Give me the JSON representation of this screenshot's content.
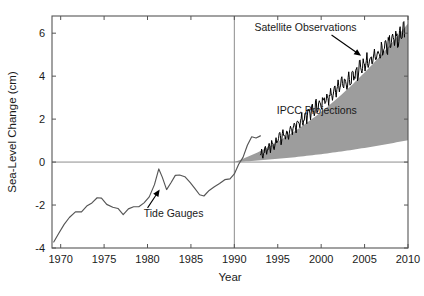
{
  "chart_data": {
    "type": "line",
    "title": "",
    "xlabel": "Year",
    "ylabel": "Sea-Level Change (cm)",
    "xlim": [
      1969,
      2010
    ],
    "ylim": [
      -4,
      6.8
    ],
    "xticks": [
      1970,
      1975,
      1980,
      1985,
      1990,
      1995,
      2000,
      2005,
      2010
    ],
    "xtick_labels": [
      "1970",
      "1975",
      "1980",
      "1985",
      "1990",
      "1995",
      "2000",
      "2005",
      "2010"
    ],
    "yticks": [
      -4,
      -2,
      0,
      2,
      4,
      6
    ],
    "ytick_labels": [
      "-4",
      "-2",
      "0",
      "2",
      "4",
      "6"
    ],
    "grid": false,
    "legend_position": "none",
    "reference_lines": [
      {
        "name": "zero-line",
        "orientation": "horizontal",
        "value": 0,
        "color": "#808080"
      },
      {
        "name": "year-1990-line",
        "orientation": "vertical",
        "value": 1990,
        "color": "#808080"
      }
    ],
    "annotations": [
      {
        "name": "satellite-observations-label",
        "text": "Satellite Observations",
        "x": 1998.2,
        "y": 6.1,
        "arrow_to_x": 2004.6,
        "arrow_to_y": 4.95
      },
      {
        "name": "ipcc-projections-label",
        "text": "IPCC Projections",
        "x": 1999.5,
        "y": 2.25,
        "arrow_to_x": null,
        "arrow_to_y": null
      },
      {
        "name": "tide-gauges-label",
        "text": "Tide Gauges",
        "x": 1983.0,
        "y": -2.55,
        "arrow_to_x": 1981.4,
        "arrow_to_y": -1.28
      }
    ],
    "series": [
      {
        "name": "Tide Gauges",
        "style": "line",
        "color": "#555555",
        "x": [
          1969.2,
          1969.8,
          1970.4,
          1971.0,
          1971.7,
          1972.4,
          1973.0,
          1973.6,
          1974.2,
          1974.7,
          1975.3,
          1976.0,
          1976.6,
          1977.2,
          1977.8,
          1978.4,
          1979.0,
          1979.6,
          1980.2,
          1980.8,
          1981.3,
          1981.7,
          1982.2,
          1982.7,
          1983.2,
          1983.7,
          1984.3,
          1984.9,
          1985.4,
          1986.0,
          1986.5,
          1987.1,
          1987.7,
          1988.3,
          1988.9,
          1989.5,
          1990.0,
          1990.5,
          1991.0,
          1991.5,
          1992.0,
          1992.5,
          1993.0
        ],
        "y": [
          -3.72,
          -3.3,
          -2.9,
          -2.58,
          -2.32,
          -2.32,
          -2.05,
          -1.9,
          -1.66,
          -1.68,
          -1.97,
          -2.1,
          -2.16,
          -2.45,
          -2.18,
          -2.08,
          -2.08,
          -1.9,
          -1.62,
          -1.05,
          -0.32,
          -0.7,
          -1.28,
          -0.96,
          -0.62,
          -0.6,
          -0.68,
          -0.95,
          -1.2,
          -1.52,
          -1.58,
          -1.32,
          -1.15,
          -1.0,
          -0.82,
          -0.78,
          -0.55,
          -0.1,
          0.22,
          0.78,
          1.18,
          1.12,
          1.22
        ]
      },
      {
        "name": "Satellite Observations",
        "style": "line-noisy",
        "color": "#000000",
        "x_start": 1993.0,
        "x_end": 2009.6,
        "trend_start": 0.3,
        "trend_end": 6.1,
        "noise_amplitude": 0.48
      },
      {
        "name": "IPCC Projections",
        "style": "band",
        "color": "#9d9d9d",
        "x_start": 1990.0,
        "x_end": 2010.0,
        "upper_start": 0.0,
        "upper_end": 6.45,
        "lower_start": 0.0,
        "lower_end": 1.02
      }
    ]
  },
  "axes": {
    "frame_color": "#555555",
    "tick_color": "#555555"
  }
}
